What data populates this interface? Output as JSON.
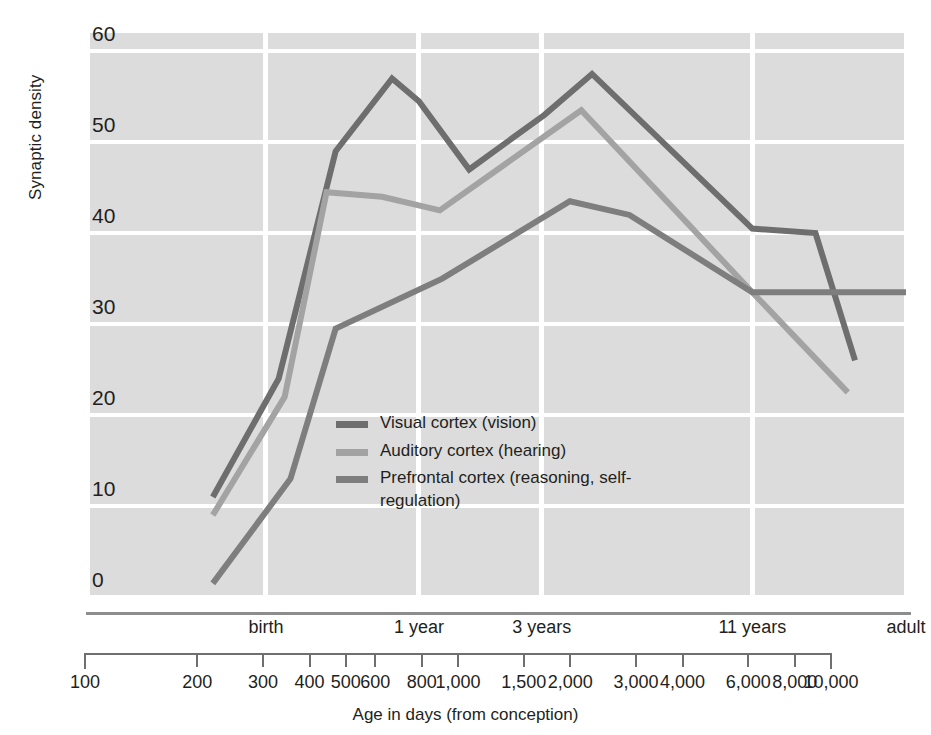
{
  "chart_data": {
    "type": "line",
    "title": "",
    "xlabel": "Age in days (from conception)",
    "ylabel": "Synaptic density",
    "x_scale": "log",
    "xlim": [
      100,
      10000
    ],
    "ylim": [
      0,
      62
    ],
    "grid": true,
    "legend_position": "inside-center-left",
    "y_ticks": [
      0,
      10,
      20,
      30,
      40,
      50,
      60
    ],
    "x_ticks": [
      100,
      200,
      300,
      400,
      500,
      600,
      800,
      1000,
      1500,
      2000,
      3000,
      4000,
      6000,
      8000,
      10000
    ],
    "x_tick_labels": [
      "100",
      "200",
      "300",
      "400",
      "500",
      "600",
      "800",
      "1,000",
      "1,500",
      "2,000",
      "3,000",
      "4,000",
      "6,000",
      "8,000",
      "10,000"
    ],
    "era_ticks": [
      {
        "label": "birth",
        "x": 270
      },
      {
        "label": "1 year",
        "x": 640
      },
      {
        "label": "3 years",
        "x": 1280
      },
      {
        "label": "11 years",
        "x": 4200
      },
      {
        "label": "adult",
        "x": 10000
      }
    ],
    "gridlines_x": [
      100,
      270,
      640,
      1280,
      4200,
      10000
    ],
    "series": [
      {
        "name": "Visual cortex (vision)",
        "color": "#6e6e6e",
        "points": [
          {
            "x": 200,
            "y": 11
          },
          {
            "x": 290,
            "y": 24
          },
          {
            "x": 400,
            "y": 49
          },
          {
            "x": 550,
            "y": 57
          },
          {
            "x": 640,
            "y": 54.5
          },
          {
            "x": 850,
            "y": 47
          },
          {
            "x": 1300,
            "y": 53
          },
          {
            "x": 1700,
            "y": 57.5
          },
          {
            "x": 4200,
            "y": 40.5
          },
          {
            "x": 6000,
            "y": 40
          },
          {
            "x": 7500,
            "y": 26
          }
        ]
      },
      {
        "name": "Auditory cortex (hearing)",
        "color": "#a3a3a3",
        "points": [
          {
            "x": 200,
            "y": 9
          },
          {
            "x": 300,
            "y": 22
          },
          {
            "x": 380,
            "y": 44.5
          },
          {
            "x": 520,
            "y": 44
          },
          {
            "x": 720,
            "y": 42.5
          },
          {
            "x": 1600,
            "y": 53.5
          },
          {
            "x": 4200,
            "y": 33.5
          },
          {
            "x": 7200,
            "y": 22.5
          }
        ]
      },
      {
        "name": "Prefrontal cortex (reasoning, self-regulation)",
        "color": "#7e7e7e",
        "points": [
          {
            "x": 200,
            "y": 1.5
          },
          {
            "x": 310,
            "y": 13
          },
          {
            "x": 400,
            "y": 29.5
          },
          {
            "x": 730,
            "y": 35
          },
          {
            "x": 1500,
            "y": 43.5
          },
          {
            "x": 2100,
            "y": 42
          },
          {
            "x": 4200,
            "y": 33.5
          },
          {
            "x": 10000,
            "y": 33.5
          }
        ]
      }
    ]
  },
  "legend": {
    "entries": [
      {
        "label": "Visual cortex (vision)",
        "color": "#6e6e6e"
      },
      {
        "label": "Auditory cortex (hearing)",
        "color": "#a3a3a3"
      },
      {
        "label": "Prefrontal cortex (reasoning, self-regulation)",
        "color": "#7e7e7e"
      }
    ]
  },
  "axes": {
    "y_title": "Synaptic density",
    "x_title": "Age in days (from conception)",
    "y_tick_labels": [
      "60",
      "50",
      "40",
      "30",
      "20",
      "10",
      "0"
    ]
  }
}
